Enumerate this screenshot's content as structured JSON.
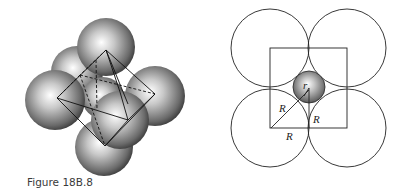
{
  "figure": {
    "caption": "Figure 18B.8"
  },
  "left_diagram": {
    "description": "Octahedral hole: six large spheres around a central small sphere with octahedron edges drawn",
    "spheres": [
      {
        "name": "back-left",
        "cx": 77,
        "cy": 72,
        "r": 26
      },
      {
        "name": "top",
        "cx": 106,
        "cy": 47,
        "r": 29
      },
      {
        "name": "center",
        "cx": 103,
        "cy": 98,
        "r": 21
      },
      {
        "name": "left",
        "cx": 55,
        "cy": 100,
        "r": 30
      },
      {
        "name": "right",
        "cx": 155,
        "cy": 96,
        "r": 30
      },
      {
        "name": "bottom",
        "cx": 104,
        "cy": 147,
        "r": 29
      },
      {
        "name": "front",
        "cx": 120,
        "cy": 120,
        "r": 29
      }
    ]
  },
  "right_diagram": {
    "description": "Cross-section: four large circles of radius R at square corners, small sphere of radius r in center",
    "labels": {
      "small_radius": "r",
      "diagonal": "R",
      "vertical": "R",
      "bottom": "R"
    },
    "colors": {
      "line": "#222222",
      "sphere_light": "#ffffff",
      "sphere_dark": "#3a3a3a"
    }
  }
}
